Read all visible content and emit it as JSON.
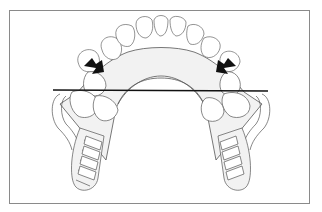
{
  "figure": {
    "type": "dental-illustration",
    "elements": [
      {
        "name": "anterior-teeth-arch",
        "count": 8
      },
      {
        "name": "major-connector",
        "shape": "horseshoe palatal strap"
      },
      {
        "name": "left-retention-saddle",
        "shape": "ladder-type grid"
      },
      {
        "name": "right-retention-saddle",
        "shape": "ladder-type grid"
      },
      {
        "name": "fulcrum-line",
        "orientation": "horizontal"
      },
      {
        "name": "left-arrow",
        "direction": "down-right"
      },
      {
        "name": "right-arrow",
        "direction": "down-left"
      }
    ],
    "colors": {
      "frame": "#8a8a8a",
      "line": "#555555",
      "fill": "#f1f1f1",
      "arrow": "#111111",
      "fulcrum": "#111111"
    }
  }
}
